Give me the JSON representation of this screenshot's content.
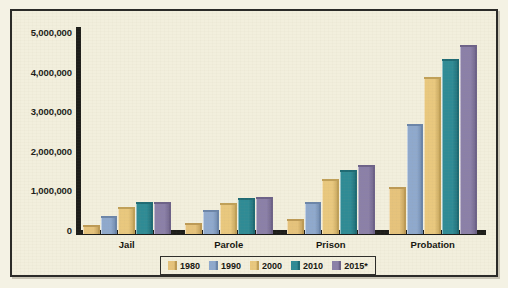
{
  "chart_data": {
    "type": "bar",
    "title": "",
    "subtitle": "",
    "xlabel": "",
    "ylabel": "",
    "categories": [
      "Jail",
      "Parole",
      "Prison",
      "Probation"
    ],
    "ylim": [
      0,
      5000000
    ],
    "ytick_labels": [
      "5,000,000",
      "4,000,000",
      "3,000,000",
      "2,000,000",
      "1,000,000",
      "0"
    ],
    "ytick_values": [
      5000000,
      4000000,
      3000000,
      2000000,
      1000000,
      0
    ],
    "grid": false,
    "legend_position": "bottom",
    "series": [
      {
        "name": "1980",
        "color": "#e6c37c",
        "edge_color": "#bd9a55",
        "values": [
          183000,
          220000,
          320000,
          1120000
        ]
      },
      {
        "name": "1990",
        "color": "#8fa9cd",
        "edge_color": "#6b85a9",
        "values": [
          405000,
          531000,
          743000,
          2670000
        ]
      },
      {
        "name": "2000",
        "color": "#e9c87e",
        "edge_color": "#c0a058",
        "values": [
          621000,
          725000,
          1310000,
          3830000
        ]
      },
      {
        "name": "2010",
        "color": "#2f8b95",
        "edge_color": "#1f6b74",
        "values": [
          748000,
          840000,
          1520000,
          4250000
        ]
      },
      {
        "name": "2015*",
        "color": "#8b80a8",
        "edge_color": "#6d6288",
        "values": [
          728000,
          870000,
          1640000,
          4600000
        ]
      }
    ],
    "footnote_marker": "*"
  }
}
